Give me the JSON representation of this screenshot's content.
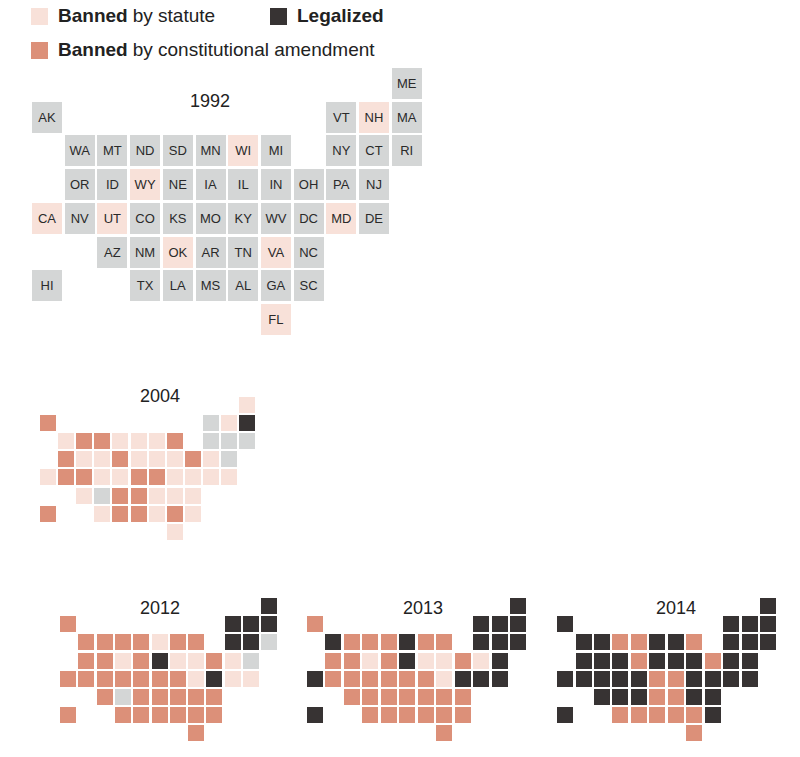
{
  "colors": {
    "none": "#d4d6d6",
    "statute": "#f8e1d9",
    "amendment": "#dc9079",
    "legal": "#373333"
  },
  "legend": {
    "items": [
      {
        "key": "statute",
        "bold": "Banned",
        "rest": "by statute",
        "color": "#f8e1d9"
      },
      {
        "key": "legal",
        "bold": "Legalized",
        "rest": "",
        "color": "#373333"
      },
      {
        "key": "amendment",
        "bold": "Banned",
        "rest": "by constitutional amendment",
        "color": "#dc9079"
      }
    ]
  },
  "layout": {
    "states": [
      {
        "s": "ME",
        "r": 0,
        "c": 11
      },
      {
        "s": "AK",
        "r": 1,
        "c": 0
      },
      {
        "s": "VT",
        "r": 1,
        "c": 9
      },
      {
        "s": "NH",
        "r": 1,
        "c": 10
      },
      {
        "s": "MA",
        "r": 1,
        "c": 11
      },
      {
        "s": "WA",
        "r": 2,
        "c": 1
      },
      {
        "s": "MT",
        "r": 2,
        "c": 2
      },
      {
        "s": "ND",
        "r": 2,
        "c": 3
      },
      {
        "s": "SD",
        "r": 2,
        "c": 4
      },
      {
        "s": "MN",
        "r": 2,
        "c": 5
      },
      {
        "s": "WI",
        "r": 2,
        "c": 6
      },
      {
        "s": "MI",
        "r": 2,
        "c": 7
      },
      {
        "s": "NY",
        "r": 2,
        "c": 9
      },
      {
        "s": "CT",
        "r": 2,
        "c": 10
      },
      {
        "s": "RI",
        "r": 2,
        "c": 11
      },
      {
        "s": "OR",
        "r": 3,
        "c": 1
      },
      {
        "s": "ID",
        "r": 3,
        "c": 2
      },
      {
        "s": "WY",
        "r": 3,
        "c": 3
      },
      {
        "s": "NE",
        "r": 3,
        "c": 4
      },
      {
        "s": "IA",
        "r": 3,
        "c": 5
      },
      {
        "s": "IL",
        "r": 3,
        "c": 6
      },
      {
        "s": "IN",
        "r": 3,
        "c": 7
      },
      {
        "s": "OH",
        "r": 3,
        "c": 8
      },
      {
        "s": "PA",
        "r": 3,
        "c": 9
      },
      {
        "s": "NJ",
        "r": 3,
        "c": 10
      },
      {
        "s": "CA",
        "r": 4,
        "c": 0
      },
      {
        "s": "NV",
        "r": 4,
        "c": 1
      },
      {
        "s": "UT",
        "r": 4,
        "c": 2
      },
      {
        "s": "CO",
        "r": 4,
        "c": 3
      },
      {
        "s": "KS",
        "r": 4,
        "c": 4
      },
      {
        "s": "MO",
        "r": 4,
        "c": 5
      },
      {
        "s": "KY",
        "r": 4,
        "c": 6
      },
      {
        "s": "WV",
        "r": 4,
        "c": 7
      },
      {
        "s": "DC",
        "r": 4,
        "c": 8
      },
      {
        "s": "MD",
        "r": 4,
        "c": 9
      },
      {
        "s": "DE",
        "r": 4,
        "c": 10
      },
      {
        "s": "AZ",
        "r": 5,
        "c": 2
      },
      {
        "s": "NM",
        "r": 5,
        "c": 3
      },
      {
        "s": "OK",
        "r": 5,
        "c": 4
      },
      {
        "s": "AR",
        "r": 5,
        "c": 5
      },
      {
        "s": "TN",
        "r": 5,
        "c": 6
      },
      {
        "s": "VA",
        "r": 5,
        "c": 7
      },
      {
        "s": "NC",
        "r": 5,
        "c": 8
      },
      {
        "s": "HI",
        "r": 6,
        "c": 0
      },
      {
        "s": "TX",
        "r": 6,
        "c": 3
      },
      {
        "s": "LA",
        "r": 6,
        "c": 4
      },
      {
        "s": "MS",
        "r": 6,
        "c": 5
      },
      {
        "s": "AL",
        "r": 6,
        "c": 6
      },
      {
        "s": "GA",
        "r": 6,
        "c": 7
      },
      {
        "s": "SC",
        "r": 6,
        "c": 8
      },
      {
        "s": "FL",
        "r": 7,
        "c": 7
      }
    ]
  },
  "maps": [
    {
      "year": "1992",
      "x": 32,
      "y": 68,
      "step_x": 32.7,
      "step_y": 33.7,
      "tile_w": 30,
      "tile_h": 31,
      "labels": true,
      "title_x": 210,
      "title_y": 91
    },
    {
      "year": "2004",
      "x": 40,
      "y": 397,
      "step_x": 18.1,
      "step_y": 18.1,
      "tile_w": 16,
      "tile_h": 16,
      "labels": false,
      "title_x": 160,
      "title_y": 386
    },
    {
      "year": "2012",
      "x": 60,
      "y": 598,
      "step_x": 18.3,
      "step_y": 18.2,
      "tile_w": 16,
      "tile_h": 16,
      "labels": false,
      "title_x": 160,
      "title_y": 598
    },
    {
      "year": "2013",
      "x": 307,
      "y": 598,
      "step_x": 18.45,
      "step_y": 18.2,
      "tile_w": 16,
      "tile_h": 16,
      "labels": false,
      "title_x": 423,
      "title_y": 598
    },
    {
      "year": "2014",
      "x": 557,
      "y": 598,
      "step_x": 18.45,
      "step_y": 18.2,
      "tile_w": 16,
      "tile_h": 16,
      "labels": false,
      "title_x": 676,
      "title_y": 598
    }
  ],
  "chart_data": {
    "type": "heatmap",
    "legend": [
      "Banned by statute",
      "Legalized",
      "Banned by constitutional amendment"
    ],
    "categories_note": "none = no specific ban (grey)",
    "years": [
      "1992",
      "2004",
      "2012",
      "2013",
      "2014"
    ],
    "status": {
      "1992": {
        "ME": "none",
        "AK": "none",
        "VT": "none",
        "NH": "statute",
        "MA": "none",
        "WA": "none",
        "MT": "none",
        "ND": "none",
        "SD": "none",
        "MN": "none",
        "WI": "statute",
        "MI": "none",
        "NY": "none",
        "CT": "none",
        "RI": "none",
        "OR": "none",
        "ID": "none",
        "WY": "statute",
        "NE": "none",
        "IA": "none",
        "IL": "none",
        "IN": "none",
        "OH": "none",
        "PA": "none",
        "NJ": "none",
        "CA": "statute",
        "NV": "none",
        "UT": "statute",
        "CO": "none",
        "KS": "none",
        "MO": "none",
        "KY": "none",
        "WV": "none",
        "DC": "none",
        "MD": "statute",
        "DE": "none",
        "AZ": "none",
        "NM": "none",
        "OK": "statute",
        "AR": "none",
        "TN": "none",
        "VA": "statute",
        "NC": "none",
        "HI": "none",
        "TX": "none",
        "LA": "none",
        "MS": "none",
        "AL": "none",
        "GA": "none",
        "SC": "none",
        "FL": "statute"
      },
      "2004": {
        "ME": "statute",
        "AK": "amendment",
        "VT": "none",
        "NH": "statute",
        "MA": "legal",
        "WA": "statute",
        "MT": "amendment",
        "ND": "amendment",
        "SD": "statute",
        "MN": "statute",
        "WI": "statute",
        "MI": "amendment",
        "NY": "none",
        "CT": "none",
        "RI": "none",
        "OR": "amendment",
        "ID": "statute",
        "WY": "statute",
        "NE": "amendment",
        "IA": "statute",
        "IL": "statute",
        "IN": "statute",
        "OH": "amendment",
        "PA": "statute",
        "NJ": "none",
        "CA": "statute",
        "NV": "amendment",
        "UT": "amendment",
        "CO": "statute",
        "KS": "statute",
        "MO": "amendment",
        "KY": "amendment",
        "WV": "statute",
        "DC": "statute",
        "MD": "statute",
        "DE": "statute",
        "AZ": "statute",
        "NM": "none",
        "OK": "amendment",
        "AR": "amendment",
        "TN": "statute",
        "VA": "statute",
        "NC": "statute",
        "HI": "amendment",
        "TX": "statute",
        "LA": "amendment",
        "MS": "amendment",
        "AL": "statute",
        "GA": "amendment",
        "SC": "statute",
        "FL": "statute"
      },
      "2012": {
        "ME": "legal",
        "AK": "amendment",
        "VT": "legal",
        "NH": "legal",
        "MA": "legal",
        "WA": "amendment",
        "MT": "amendment",
        "ND": "amendment",
        "SD": "amendment",
        "MN": "statute",
        "WI": "amendment",
        "MI": "amendment",
        "NY": "legal",
        "CT": "legal",
        "RI": "none",
        "OR": "amendment",
        "ID": "amendment",
        "WY": "statute",
        "NE": "amendment",
        "IA": "legal",
        "IL": "statute",
        "IN": "statute",
        "OH": "amendment",
        "PA": "statute",
        "NJ": "none",
        "CA": "amendment",
        "NV": "amendment",
        "UT": "amendment",
        "CO": "amendment",
        "KS": "amendment",
        "MO": "amendment",
        "KY": "amendment",
        "WV": "statute",
        "DC": "legal",
        "MD": "statute",
        "DE": "statute",
        "AZ": "amendment",
        "NM": "none",
        "OK": "amendment",
        "AR": "amendment",
        "TN": "amendment",
        "VA": "amendment",
        "NC": "amendment",
        "HI": "amendment",
        "TX": "amendment",
        "LA": "amendment",
        "MS": "amendment",
        "AL": "amendment",
        "GA": "amendment",
        "SC": "amendment",
        "FL": "amendment"
      },
      "2013": {
        "ME": "legal",
        "AK": "amendment",
        "VT": "legal",
        "NH": "legal",
        "MA": "legal",
        "WA": "legal",
        "MT": "amendment",
        "ND": "amendment",
        "SD": "amendment",
        "MN": "legal",
        "WI": "amendment",
        "MI": "amendment",
        "NY": "legal",
        "CT": "legal",
        "RI": "legal",
        "OR": "amendment",
        "ID": "amendment",
        "WY": "statute",
        "NE": "amendment",
        "IA": "legal",
        "IL": "statute",
        "IN": "statute",
        "OH": "amendment",
        "PA": "statute",
        "NJ": "legal",
        "CA": "legal",
        "NV": "amendment",
        "UT": "amendment",
        "CO": "amendment",
        "KS": "amendment",
        "MO": "amendment",
        "KY": "amendment",
        "WV": "statute",
        "DC": "legal",
        "MD": "legal",
        "DE": "legal",
        "AZ": "amendment",
        "NM": "amendment",
        "OK": "amendment",
        "AR": "amendment",
        "TN": "amendment",
        "VA": "amendment",
        "NC": "amendment",
        "HI": "legal",
        "TX": "amendment",
        "LA": "amendment",
        "MS": "amendment",
        "AL": "amendment",
        "GA": "amendment",
        "SC": "amendment",
        "FL": "amendment"
      },
      "2014": {
        "ME": "legal",
        "AK": "legal",
        "VT": "legal",
        "NH": "legal",
        "MA": "legal",
        "WA": "legal",
        "MT": "legal",
        "ND": "amendment",
        "SD": "amendment",
        "MN": "legal",
        "WI": "legal",
        "MI": "amendment",
        "NY": "legal",
        "CT": "legal",
        "RI": "legal",
        "OR": "legal",
        "ID": "legal",
        "WY": "legal",
        "NE": "amendment",
        "IA": "legal",
        "IL": "legal",
        "IN": "legal",
        "OH": "amendment",
        "PA": "legal",
        "NJ": "legal",
        "CA": "legal",
        "NV": "legal",
        "UT": "legal",
        "CO": "legal",
        "KS": "legal",
        "MO": "amendment",
        "KY": "amendment",
        "WV": "legal",
        "DC": "legal",
        "MD": "legal",
        "DE": "legal",
        "AZ": "legal",
        "NM": "legal",
        "OK": "legal",
        "AR": "amendment",
        "TN": "amendment",
        "VA": "legal",
        "NC": "legal",
        "HI": "legal",
        "TX": "amendment",
        "LA": "amendment",
        "MS": "amendment",
        "AL": "amendment",
        "GA": "amendment",
        "SC": "legal",
        "FL": "amendment"
      }
    }
  }
}
